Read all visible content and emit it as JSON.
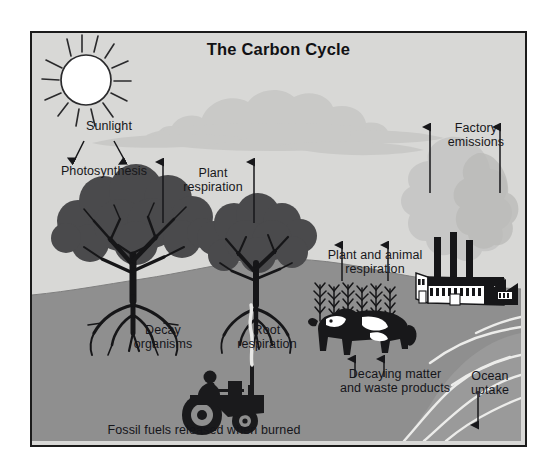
{
  "figure": {
    "title": "The Carbon Cycle",
    "domain": "diagram",
    "frame": {
      "border_color": "#1b1b1b",
      "sky_color": "#d8d8d6",
      "ground_color": "#8f8f8f"
    }
  },
  "palette": {
    "sky": "#d8d8d6",
    "ground": "#8f8f8f",
    "cloud": "#c9c9c7",
    "smoke": "#c6c6c4",
    "tree_dark": "#4a4a4c",
    "ink": "#17171a",
    "white": "#ffffff",
    "water_line": "#ececea"
  },
  "labels": {
    "sunlight": "Sunlight",
    "photosynthesis": "Photosynthesis",
    "plant_respiration": "Plant\nrespiration",
    "factory_emissions": "Factory\nemissions",
    "plant_animal_respiration": "Plant and animal\nrespiration",
    "decay_organisms": "Decay\norganisms",
    "root_respiration": "Root\nrespiration",
    "decaying_matter": "Decaying matter\nand waste products",
    "ocean_uptake": "Ocean\nuptake",
    "fossil_fuels": "Fossil fuels released when burned"
  },
  "icons": {
    "sun": "sun-icon",
    "cloud": "cloud-icon",
    "tree_left": "tree-icon",
    "tree_right": "tree-icon",
    "grass": "grass-icon",
    "cow": "cow-icon",
    "factory": "factory-icon",
    "smoke": "smoke-icon",
    "tractor": "tractor-icon",
    "ocean": "ocean-waves-icon",
    "arrow_up": "arrow-up-icon",
    "arrow_down": "arrow-down-icon"
  },
  "arrows": [
    {
      "name": "sunlight-to-photosynthesis-left",
      "direction": "down"
    },
    {
      "name": "sunlight-to-photosynthesis-right",
      "direction": "down"
    },
    {
      "name": "plant-respiration-left",
      "direction": "up"
    },
    {
      "name": "plant-respiration-right",
      "direction": "up"
    },
    {
      "name": "plant-animal-respiration-left",
      "direction": "up"
    },
    {
      "name": "plant-animal-respiration-right",
      "direction": "up"
    },
    {
      "name": "decaying-matter-left",
      "direction": "up"
    },
    {
      "name": "decaying-matter-right",
      "direction": "up"
    },
    {
      "name": "factory-emissions-left",
      "direction": "up"
    },
    {
      "name": "factory-emissions-right",
      "direction": "up"
    },
    {
      "name": "ocean-uptake",
      "direction": "down"
    }
  ]
}
